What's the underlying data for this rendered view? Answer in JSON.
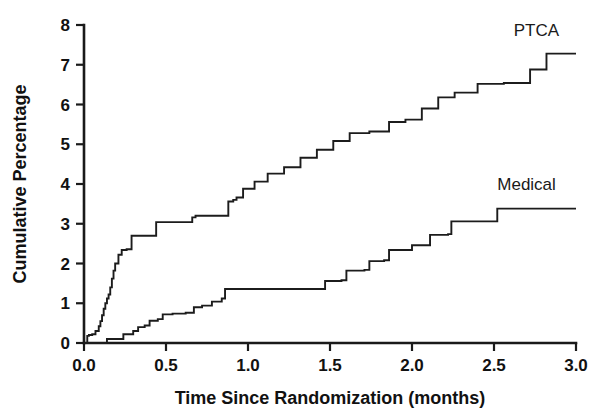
{
  "chart_data": {
    "type": "line",
    "subtype": "step-function cumulative incidence (Kaplan-Meier style)",
    "title": "",
    "xlabel": "Time Since Randomization (months)",
    "ylabel": "Cumulative Percentage",
    "xlim": [
      0.0,
      3.0
    ],
    "ylim": [
      0,
      8
    ],
    "xticks": [
      0.0,
      0.5,
      1.0,
      1.5,
      2.0,
      2.5,
      3.0
    ],
    "xtick_labels": [
      "0.0",
      "0.5",
      "1.0",
      "1.5",
      "2.0",
      "2.5",
      "3.0"
    ],
    "yticks": [
      0,
      1,
      2,
      3,
      4,
      5,
      6,
      7,
      8
    ],
    "ytick_labels": [
      "0",
      "1",
      "2",
      "3",
      "4",
      "5",
      "6",
      "7",
      "8"
    ],
    "grid": false,
    "legend_position": "inline-curve-labels",
    "line_color": "#1c1c1c",
    "background_color": "#ffffff",
    "series": [
      {
        "name": "PTCA",
        "label": "PTCA",
        "label_x": 2.62,
        "label_y": 7.72,
        "final_value": 7.28,
        "x": [
          0.0,
          0.02,
          0.03,
          0.04,
          0.05,
          0.07,
          0.09,
          0.1,
          0.11,
          0.12,
          0.13,
          0.14,
          0.15,
          0.16,
          0.17,
          0.18,
          0.19,
          0.21,
          0.23,
          0.26,
          0.29,
          0.44,
          0.5,
          0.66,
          0.68,
          0.88,
          0.91,
          0.93,
          0.97,
          1.04,
          1.12,
          1.22,
          1.32,
          1.42,
          1.52,
          1.62,
          1.74,
          1.86,
          1.96,
          2.06,
          2.16,
          2.26,
          2.4,
          2.56,
          2.72,
          2.82,
          3.0
        ],
        "y": [
          0.0,
          0.18,
          0.2,
          0.2,
          0.22,
          0.3,
          0.42,
          0.55,
          0.7,
          0.86,
          1.0,
          1.12,
          1.22,
          1.4,
          1.62,
          1.82,
          2.0,
          2.22,
          2.34,
          2.36,
          2.7,
          3.04,
          3.04,
          3.16,
          3.2,
          3.56,
          3.6,
          3.66,
          3.88,
          4.06,
          4.26,
          4.42,
          4.66,
          4.86,
          5.08,
          5.28,
          5.32,
          5.56,
          5.62,
          5.9,
          6.18,
          6.3,
          6.52,
          6.54,
          6.88,
          7.28,
          7.28
        ]
      },
      {
        "name": "Medical",
        "label": "Medical",
        "label_x": 2.52,
        "label_y": 3.85,
        "final_value": 3.38,
        "x": [
          0.0,
          0.12,
          0.14,
          0.22,
          0.24,
          0.3,
          0.33,
          0.37,
          0.4,
          0.45,
          0.48,
          0.54,
          0.62,
          0.67,
          0.72,
          0.78,
          0.84,
          0.86,
          1.44,
          1.47,
          1.57,
          1.6,
          1.71,
          1.74,
          1.83,
          1.86,
          2.0,
          2.11,
          2.22,
          2.24,
          2.5,
          2.52,
          3.0
        ],
        "y": [
          0.0,
          0.0,
          0.1,
          0.1,
          0.22,
          0.3,
          0.4,
          0.44,
          0.56,
          0.6,
          0.72,
          0.74,
          0.76,
          0.9,
          0.94,
          1.04,
          1.12,
          1.36,
          1.36,
          1.56,
          1.58,
          1.82,
          1.84,
          2.06,
          2.08,
          2.34,
          2.46,
          2.72,
          2.74,
          3.06,
          3.06,
          3.38,
          3.38
        ]
      }
    ]
  },
  "axes": {
    "y_axis_title": "Cumulative Percentage",
    "x_axis_title": "Time Since Randomization (months)"
  }
}
